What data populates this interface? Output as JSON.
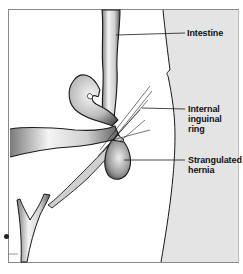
{
  "diagram": {
    "type": "anatomical-illustration",
    "colors": {
      "background": "#ffffff",
      "abdominal_wall_panel": "#e4e4e4",
      "outline": "#1a1a1a",
      "frame": "#8a8a8a",
      "label_text": "#111111"
    },
    "labels": [
      {
        "id": "intestine",
        "text": "Intestine"
      },
      {
        "id": "internal-inguinal-ring",
        "lines": [
          "Internal",
          "inguinal",
          "ring"
        ]
      },
      {
        "id": "strangulated-hernia",
        "lines": [
          "Strangulated",
          "hernia"
        ]
      }
    ]
  }
}
